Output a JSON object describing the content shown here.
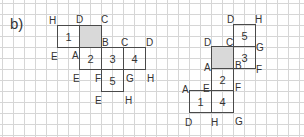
{
  "part_label": "b)",
  "colors": {
    "grid": "#d6d6d6",
    "outline": "#4a4a4a",
    "shaded": "#d9d9d9",
    "text": "#333333"
  },
  "left_net": {
    "squares": [
      {
        "label": "1",
        "x": 57,
        "y": 25,
        "shaded": false
      },
      {
        "label": "",
        "x": 79,
        "y": 25,
        "shaded": true
      },
      {
        "label": "2",
        "x": 79,
        "y": 47,
        "shaded": false
      },
      {
        "label": "3",
        "x": 101,
        "y": 47,
        "shaded": false
      },
      {
        "label": "4",
        "x": 123,
        "y": 47,
        "shaded": false
      },
      {
        "label": "5",
        "x": 101,
        "y": 69,
        "shaded": false
      }
    ],
    "vertices": [
      {
        "t": "H",
        "x": 49,
        "y": 16
      },
      {
        "t": "D",
        "x": 76,
        "y": 15
      },
      {
        "t": "C",
        "x": 101,
        "y": 15
      },
      {
        "t": "B",
        "x": 102,
        "y": 38
      },
      {
        "t": "C",
        "x": 121,
        "y": 38
      },
      {
        "t": "D",
        "x": 146,
        "y": 38
      },
      {
        "t": "E",
        "x": 51,
        "y": 52
      },
      {
        "t": "A",
        "x": 72,
        "y": 51
      },
      {
        "t": "E",
        "x": 73,
        "y": 74
      },
      {
        "t": "F",
        "x": 95,
        "y": 74
      },
      {
        "t": "G",
        "x": 126,
        "y": 74
      },
      {
        "t": "H",
        "x": 147,
        "y": 74
      },
      {
        "t": "E",
        "x": 95,
        "y": 96
      },
      {
        "t": "H",
        "x": 125,
        "y": 96
      }
    ]
  },
  "right_net": {
    "squares": [
      {
        "label": "5",
        "x": 233,
        "y": 24,
        "shaded": false
      },
      {
        "label": "",
        "x": 211,
        "y": 46,
        "shaded": true
      },
      {
        "label": "3",
        "x": 233,
        "y": 46,
        "shaded": false
      },
      {
        "label": "2",
        "x": 211,
        "y": 68,
        "shaded": false
      },
      {
        "label": "1",
        "x": 189,
        "y": 90,
        "shaded": false
      },
      {
        "label": "4",
        "x": 211,
        "y": 90,
        "shaded": false
      }
    ],
    "vertices": [
      {
        "t": "D",
        "x": 227,
        "y": 15
      },
      {
        "t": "H",
        "x": 255,
        "y": 15
      },
      {
        "t": "D",
        "x": 204,
        "y": 38
      },
      {
        "t": "C",
        "x": 226,
        "y": 38
      },
      {
        "t": "G",
        "x": 256,
        "y": 43
      },
      {
        "t": "A",
        "x": 204,
        "y": 63
      },
      {
        "t": "B",
        "x": 235,
        "y": 61
      },
      {
        "t": "F",
        "x": 256,
        "y": 65
      },
      {
        "t": "A",
        "x": 182,
        "y": 85
      },
      {
        "t": "E",
        "x": 203,
        "y": 84
      },
      {
        "t": "F",
        "x": 235,
        "y": 83
      },
      {
        "t": "D",
        "x": 185,
        "y": 118
      },
      {
        "t": "H",
        "x": 211,
        "y": 118
      },
      {
        "t": "G",
        "x": 235,
        "y": 117
      }
    ]
  }
}
